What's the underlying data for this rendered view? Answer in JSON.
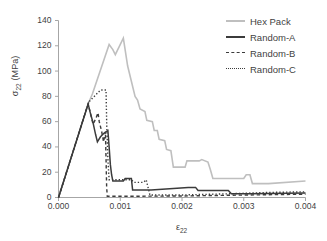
{
  "chart_data": {
    "type": "line",
    "title": "",
    "xlabel": "ε₂₂",
    "ylabel": "σ₂₂ (MPa)",
    "xlim": [
      0.0,
      0.004
    ],
    "ylim": [
      0,
      140
    ],
    "xticks": [
      "0.000",
      "0.001",
      "0.002",
      "0.003",
      "0.004"
    ],
    "xtick_values": [
      0.0,
      0.001,
      0.002,
      0.003,
      0.004
    ],
    "yticks": [
      "0",
      "20",
      "40",
      "60",
      "80",
      "100",
      "120",
      "140"
    ],
    "ytick_values": [
      0,
      20,
      40,
      60,
      80,
      100,
      120,
      140
    ],
    "grid": false,
    "legend_position": "top-right",
    "series": [
      {
        "name": "Hex Pack",
        "style": "solid",
        "color": "#bfbfbf",
        "width": 1.6,
        "points": [
          [
            0.0,
            0
          ],
          [
            0.00048,
            74
          ],
          [
            0.00055,
            82
          ],
          [
            0.00082,
            121
          ],
          [
            0.00088,
            117
          ],
          [
            0.00092,
            113
          ],
          [
            0.00105,
            126
          ],
          [
            0.00112,
            104
          ],
          [
            0.00118,
            92
          ],
          [
            0.00124,
            80
          ],
          [
            0.00128,
            77
          ],
          [
            0.00132,
            70
          ],
          [
            0.0014,
            68
          ],
          [
            0.00143,
            61
          ],
          [
            0.00152,
            60
          ],
          [
            0.00155,
            53
          ],
          [
            0.0016,
            53
          ],
          [
            0.00163,
            46
          ],
          [
            0.00172,
            45
          ],
          [
            0.00175,
            38
          ],
          [
            0.00182,
            37
          ],
          [
            0.00186,
            24
          ],
          [
            0.00205,
            24
          ],
          [
            0.00208,
            29
          ],
          [
            0.00228,
            29
          ],
          [
            0.00232,
            30
          ],
          [
            0.00242,
            28
          ],
          [
            0.00246,
            22
          ],
          [
            0.0025,
            15
          ],
          [
            0.003,
            15
          ],
          [
            0.00304,
            18
          ],
          [
            0.0031,
            18
          ],
          [
            0.00314,
            11
          ],
          [
            0.0034,
            11
          ],
          [
            0.004,
            13
          ]
        ]
      },
      {
        "name": "Random-A",
        "style": "solid",
        "color": "#3b3b3b",
        "width": 1.5,
        "points": [
          [
            0.0,
            0
          ],
          [
            0.00048,
            74
          ],
          [
            0.00052,
            66
          ],
          [
            0.00056,
            59
          ],
          [
            0.0006,
            50
          ],
          [
            0.00063,
            44
          ],
          [
            0.00068,
            48
          ],
          [
            0.00074,
            51
          ],
          [
            0.0008,
            53
          ],
          [
            0.00082,
            40
          ],
          [
            0.00084,
            26
          ],
          [
            0.00086,
            18
          ],
          [
            0.00088,
            13
          ],
          [
            0.00105,
            13
          ],
          [
            0.00108,
            15
          ],
          [
            0.00118,
            15
          ],
          [
            0.0012,
            6
          ],
          [
            0.0015,
            6
          ],
          [
            0.0021,
            8
          ],
          [
            0.00222,
            8
          ],
          [
            0.00226,
            5.5
          ],
          [
            0.00275,
            5.5
          ],
          [
            0.0028,
            3
          ],
          [
            0.0031,
            3
          ],
          [
            0.004,
            3.5
          ]
        ]
      },
      {
        "name": "Random-B",
        "style": "dashed",
        "color": "#3b3b3b",
        "width": 1.4,
        "points": [
          [
            0.0,
            0
          ],
          [
            0.00044,
            68
          ],
          [
            0.00048,
            74
          ],
          [
            0.00052,
            66
          ],
          [
            0.00056,
            58
          ],
          [
            0.0006,
            62
          ],
          [
            0.00064,
            67
          ],
          [
            0.00066,
            60
          ],
          [
            0.0007,
            52
          ],
          [
            0.00073,
            44
          ],
          [
            0.00076,
            52
          ],
          [
            0.00077,
            30
          ],
          [
            0.00078,
            8
          ],
          [
            0.00079,
            1
          ],
          [
            0.0012,
            1
          ],
          [
            0.002,
            1.2
          ],
          [
            0.0028,
            1.8
          ],
          [
            0.0034,
            2.2
          ],
          [
            0.004,
            2.6
          ]
        ]
      },
      {
        "name": "Random-C",
        "style": "dotted",
        "color": "#3b3b3b",
        "width": 1.4,
        "points": [
          [
            0.0,
            0
          ],
          [
            0.00046,
            71
          ],
          [
            0.0005,
            76
          ],
          [
            0.00056,
            79
          ],
          [
            0.00062,
            82
          ],
          [
            0.00068,
            85
          ],
          [
            0.00077,
            85
          ],
          [
            0.00078,
            60
          ],
          [
            0.0008,
            30
          ],
          [
            0.00082,
            14
          ],
          [
            0.0009,
            14
          ],
          [
            0.00118,
            14
          ],
          [
            0.00122,
            12
          ],
          [
            0.00138,
            12
          ],
          [
            0.00142,
            14
          ],
          [
            0.00148,
            2
          ],
          [
            0.002,
            2
          ],
          [
            0.0028,
            3
          ],
          [
            0.0034,
            4
          ],
          [
            0.004,
            4.5
          ]
        ]
      }
    ]
  },
  "legend": {
    "items": [
      {
        "label": "Hex Pack",
        "swatch": "sw-solid-l"
      },
      {
        "label": "Random-A",
        "swatch": "sw-solid-d"
      },
      {
        "label": "Random-B",
        "swatch": "sw-dash"
      },
      {
        "label": "Random-C",
        "swatch": "sw-dot"
      }
    ]
  },
  "axis": {
    "ylabel_sigma": "σ",
    "ylabel_sub": "22",
    "ylabel_unit": " (MPa)",
    "xlabel_eps": "ε",
    "xlabel_sub": "22"
  },
  "colors": {
    "hex_pack": "#bfbfbf",
    "random": "#3b3b3b",
    "axis": "#a6a6a6",
    "text": "#3f3f3f"
  }
}
